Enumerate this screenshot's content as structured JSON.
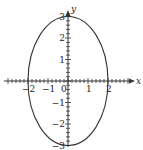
{
  "chart_data": {
    "type": "line",
    "title": "",
    "equation": "x^2/4 + y^2/9 = 1",
    "xlabel": "x",
    "ylabel": "y",
    "xlim": [
      -3,
      3
    ],
    "ylim": [
      -3,
      3
    ],
    "grid": false,
    "x_ticks": [
      -2,
      -1,
      0,
      1,
      2
    ],
    "x_tick_labels": [
      "−2",
      "−1",
      "0",
      "1",
      "2"
    ],
    "y_ticks": [
      -3,
      -2,
      -1,
      1,
      2,
      3
    ],
    "y_tick_labels": [
      "−3",
      "−2",
      "−1",
      "1",
      "2",
      "3"
    ],
    "series": [
      {
        "name": "ellipse",
        "semi_axis_x": 2,
        "semi_axis_y": 3,
        "center": [
          0,
          0
        ],
        "key_points": [
          [
            2,
            0
          ],
          [
            0,
            3
          ],
          [
            -2,
            0
          ],
          [
            0,
            -3
          ]
        ]
      }
    ],
    "colors": {
      "curve": "#333333",
      "axes": "#333333"
    }
  }
}
